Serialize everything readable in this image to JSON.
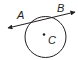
{
  "diagram": {
    "type": "circle-with-secant",
    "labels": {
      "point_a": "A",
      "point_b": "B",
      "center": "C"
    },
    "colors": {
      "stroke": "#231f20",
      "background": "#ffffff"
    }
  }
}
